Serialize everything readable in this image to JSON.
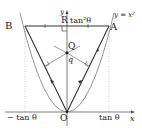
{
  "diagram": {
    "curve_label": "y = x²",
    "axis_x_label": "x",
    "axis_y_label": "y",
    "points": {
      "A": "A",
      "B": "B",
      "O": "O",
      "Q": "Q",
      "R": "R"
    },
    "q_label": "q",
    "top_label": "tan²θ",
    "x_ticks": {
      "left": "− tan θ",
      "right": "tan θ"
    },
    "colors": {
      "line": "#333333",
      "guide": "#999999",
      "curve": "#555555"
    }
  }
}
